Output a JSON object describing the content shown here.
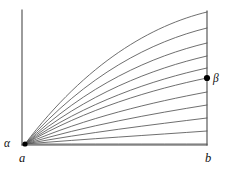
{
  "figure": {
    "width": 230,
    "height": 169,
    "background_color": "#ffffff",
    "line_color": "#555555",
    "axis_color": "#4a4a4a",
    "dot_color": "#000000",
    "labels": {
      "alpha": "α",
      "beta": "β",
      "a": "a",
      "b": "b"
    },
    "label_positions": {
      "alpha": {
        "x": 4,
        "y": 147
      },
      "beta": {
        "x": 213,
        "y": 82
      },
      "a": {
        "x": 19,
        "y": 162
      },
      "b": {
        "x": 205,
        "y": 162
      }
    },
    "points": [
      {
        "name": "a",
        "x": 25,
        "y": 144,
        "marker": "dot-implicit"
      },
      {
        "name": "b",
        "x": 207,
        "y": 145,
        "marker": "none"
      },
      {
        "name": "beta",
        "x": 207,
        "y": 78,
        "marker": "filled-dot",
        "radius": 3.1
      }
    ],
    "axes": {
      "left_vertical": {
        "x": 22,
        "y_top": 10,
        "y_bottom": 145
      },
      "right_vertical": {
        "x": 207,
        "y_top": 11,
        "y_bottom": 145
      },
      "baseline": {
        "y": 145,
        "x_left": 22,
        "x_right": 207
      }
    }
  },
  "chart_data": {
    "type": "line",
    "title": "",
    "xlabel": "",
    "ylabel": "",
    "grid": false,
    "legend": null,
    "xlim": [
      22,
      207
    ],
    "ylim": [
      145,
      10
    ],
    "origin": {
      "x": 25,
      "y": 144
    },
    "series": [
      {
        "name": "curve-1",
        "end": {
          "x": 207,
          "y": 12
        },
        "sag": 0.0
      },
      {
        "name": "curve-2",
        "end": {
          "x": 207,
          "y": 28
        },
        "sag": 0.03
      },
      {
        "name": "curve-3",
        "end": {
          "x": 207,
          "y": 43
        },
        "sag": 0.06
      },
      {
        "name": "curve-4",
        "end": {
          "x": 207,
          "y": 56
        },
        "sag": 0.09
      },
      {
        "name": "curve-5",
        "end": {
          "x": 207,
          "y": 68
        },
        "sag": 0.12
      },
      {
        "name": "curve-6",
        "end": {
          "x": 207,
          "y": 78
        },
        "sag": 0.15
      },
      {
        "name": "curve-7",
        "end": {
          "x": 207,
          "y": 92
        },
        "sag": 0.2
      },
      {
        "name": "curve-8",
        "end": {
          "x": 207,
          "y": 105
        },
        "sag": 0.26
      },
      {
        "name": "curve-9",
        "end": {
          "x": 207,
          "y": 118
        },
        "sag": 0.33
      },
      {
        "name": "curve-10",
        "end": {
          "x": 207,
          "y": 131
        },
        "sag": 0.42
      },
      {
        "name": "curve-11",
        "end": {
          "x": 207,
          "y": 144
        },
        "sag": 0.62
      }
    ]
  }
}
